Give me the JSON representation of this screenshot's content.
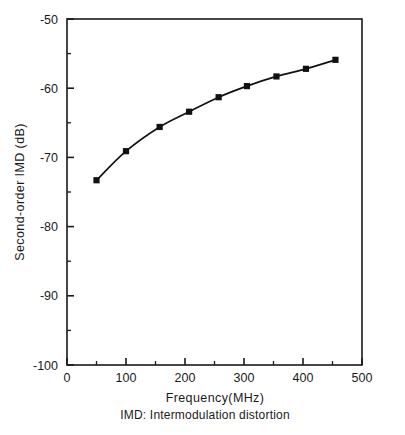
{
  "chart_data": {
    "type": "line",
    "title": "",
    "xlabel": "Frequency(MHz)",
    "ylabel": "Second-order IMD (dB)",
    "caption": "IMD: Intermodulation distortion",
    "xlim": [
      0,
      500
    ],
    "ylim": [
      -100,
      -50
    ],
    "grid": false,
    "legend": null,
    "x_ticks": [
      0,
      100,
      200,
      300,
      400,
      500
    ],
    "x_tick_labels": [
      "0",
      "100",
      "200",
      "300",
      "400",
      "500"
    ],
    "x_minor_ticks": [
      50,
      150,
      250,
      350,
      450
    ],
    "y_ticks": [
      -50,
      -60,
      -70,
      -80,
      -90,
      -100
    ],
    "y_tick_labels": [
      "-50",
      "-60",
      "-70",
      "-80",
      "-90",
      "-100"
    ],
    "y_minor_ticks": [
      -55,
      -65,
      -75,
      -85,
      -95
    ],
    "marker": "filled-square",
    "marker_color": "#111111",
    "line_color": "#111111",
    "x": [
      50,
      100,
      157,
      207,
      257,
      305,
      355,
      405,
      455
    ],
    "values": [
      -73.3,
      -69.1,
      -65.6,
      -63.4,
      -61.3,
      -59.7,
      -58.3,
      -57.2,
      -55.9
    ],
    "series": [
      {
        "name": "Second-order IMD",
        "x": [
          50,
          100,
          157,
          207,
          257,
          305,
          355,
          405,
          455
        ],
        "values": [
          -73.3,
          -69.1,
          -65.6,
          -63.4,
          -61.3,
          -59.7,
          -58.3,
          -57.2,
          -55.9
        ]
      }
    ]
  },
  "axes": {
    "x_label": "Frequency(MHz)",
    "y_label": "Second-order IMD (dB)"
  },
  "caption": {
    "text": "IMD: Intermodulation distortion"
  },
  "colors": {
    "line": "#111111",
    "marker": "#111111",
    "axis": "#1a1a1a",
    "background": "#ffffff"
  }
}
